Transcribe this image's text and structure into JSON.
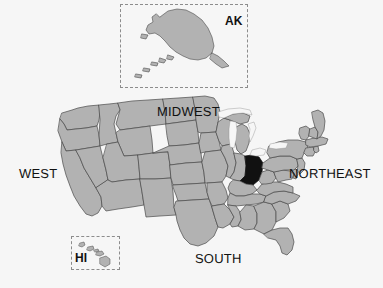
{
  "figure": {
    "kind": "choropleth-locator-map",
    "background_color": "#f6f6f6"
  },
  "palette": {
    "background": "#f6f6f6",
    "state_fill": "#b2b2b2",
    "state_stroke": "#4a4a4a",
    "highlight_fill": "#111111",
    "lake_fill": "#f6f6f6",
    "inset_border": "#8c8c8c",
    "label_color": "#111111"
  },
  "region_labels": [
    {
      "id": "west",
      "text": "WEST",
      "x": 19,
      "y": 167
    },
    {
      "id": "midwest",
      "text": "MIDWEST",
      "x": 157,
      "y": 105
    },
    {
      "id": "northeast",
      "text": "NORTHEAST",
      "x": 289,
      "y": 167
    },
    {
      "id": "south",
      "text": "SOUTH",
      "x": 195,
      "y": 252
    }
  ],
  "insets": [
    {
      "id": "ak",
      "label": "AK",
      "name": "Alaska",
      "box": {
        "x": 120,
        "y": 4,
        "width": 128,
        "height": 84
      },
      "border_style": "dashed",
      "label_position": {
        "x": 225,
        "y": 15
      }
    },
    {
      "id": "hi",
      "label": "HI",
      "name": "Hawaii",
      "box": {
        "x": 71,
        "y": 236,
        "width": 49,
        "height": 34
      },
      "border_style": "dashed",
      "label_position": {
        "x": 75,
        "y": 252
      }
    }
  ],
  "highlight": {
    "state_code": "OH",
    "state_name": "Ohio",
    "region": "MIDWEST",
    "fill": "#111111",
    "bbox": {
      "x": 236,
      "y": 156,
      "width": 27,
      "height": 30
    }
  },
  "legend": {
    "highlighted_meaning": "highlighted state",
    "default_meaning": "other states"
  }
}
